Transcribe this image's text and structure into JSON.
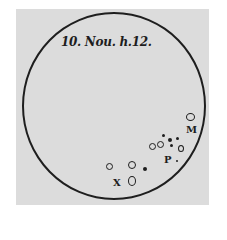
{
  "figure": {
    "caption": "10. Nou. h.12.",
    "markers": {
      "m": "M",
      "p": "P",
      "x": "X"
    },
    "colors": {
      "ink": "#1e1e1e",
      "paper": "#dcdcdc"
    }
  }
}
